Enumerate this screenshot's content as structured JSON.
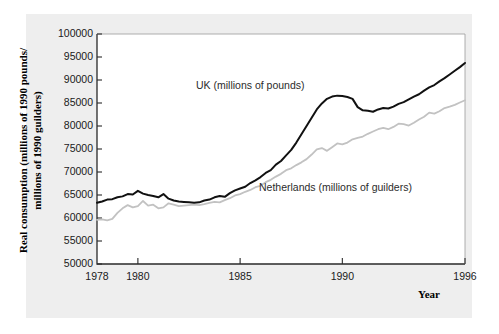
{
  "chart_data": {
    "type": "line",
    "title": "",
    "subtitle": "",
    "xlabel": "Year",
    "ylabel": "Real consumption (millions of 1990 pounds/\nmillions of 1990 guilders)",
    "ylabel_line1": "Real consumption (millions of 1990 pounds/",
    "ylabel_line2": "millions of 1990 guilders)",
    "xlim": [
      1978,
      1996
    ],
    "ylim": [
      50000,
      100000
    ],
    "grid": false,
    "legend_position": "inline-annotations",
    "y_ticks": [
      50000,
      55000,
      60000,
      65000,
      70000,
      75000,
      80000,
      85000,
      90000,
      95000,
      100000
    ],
    "y_tick_labels": [
      "50000",
      "55000",
      "60000",
      "65000",
      "70000",
      "75000",
      "80000",
      "85000",
      "90000",
      "95000",
      "100000"
    ],
    "x_ticks": [
      1978,
      1980,
      1985,
      1990,
      1996
    ],
    "x_tick_labels": [
      "1978",
      "1980",
      "1985",
      "1990",
      "1996"
    ],
    "annotations": [
      {
        "text": "UK (millions of pounds)",
        "x": 1983.6,
        "y": 88000
      },
      {
        "text": "Netherlands (millions of guilders)",
        "x": 1986.8,
        "y": 67500
      }
    ],
    "series": [
      {
        "name": "UK (millions of pounds)",
        "color": "#111111",
        "line_width": 2.0,
        "x": [
          1978.0,
          1978.25,
          1978.5,
          1978.75,
          1979.0,
          1979.25,
          1979.5,
          1979.75,
          1980.0,
          1980.25,
          1980.5,
          1980.75,
          1981.0,
          1981.25,
          1981.5,
          1981.75,
          1982.0,
          1982.25,
          1982.5,
          1982.75,
          1983.0,
          1983.25,
          1983.5,
          1983.75,
          1984.0,
          1984.25,
          1984.5,
          1984.75,
          1985.0,
          1985.25,
          1985.5,
          1985.75,
          1986.0,
          1986.25,
          1986.5,
          1986.75,
          1987.0,
          1987.25,
          1987.5,
          1987.75,
          1988.0,
          1988.25,
          1988.5,
          1988.75,
          1989.0,
          1989.25,
          1989.5,
          1989.75,
          1990.0,
          1990.25,
          1990.5,
          1990.75,
          1991.0,
          1991.25,
          1991.5,
          1991.75,
          1992.0,
          1992.25,
          1992.5,
          1992.75,
          1993.0,
          1993.25,
          1993.5,
          1993.75,
          1994.0,
          1994.25,
          1994.5,
          1994.75,
          1995.0,
          1995.25,
          1995.5,
          1995.75,
          1996.0
        ],
        "values": [
          63300,
          63600,
          64000,
          64100,
          64500,
          64700,
          65200,
          65100,
          65900,
          65300,
          65000,
          64800,
          64500,
          65200,
          64200,
          63800,
          63600,
          63500,
          63400,
          63300,
          63400,
          63800,
          64000,
          64500,
          64800,
          64600,
          65400,
          66000,
          66400,
          66800,
          67600,
          68200,
          68900,
          69800,
          70400,
          71600,
          72400,
          73600,
          74800,
          76400,
          78200,
          80000,
          81800,
          83600,
          84900,
          85900,
          86400,
          86600,
          86500,
          86300,
          85900,
          84100,
          83400,
          83300,
          83100,
          83600,
          83900,
          83800,
          84200,
          84800,
          85200,
          85800,
          86400,
          86900,
          87700,
          88400,
          88900,
          89700,
          90400,
          91200,
          92000,
          92800,
          93700
        ]
      },
      {
        "name": "Netherlands (millions of guilders)",
        "color": "#c2c2c2",
        "line_width": 1.8,
        "x": [
          1978.0,
          1978.25,
          1978.5,
          1978.75,
          1979.0,
          1979.25,
          1979.5,
          1979.75,
          1980.0,
          1980.25,
          1980.5,
          1980.75,
          1981.0,
          1981.25,
          1981.5,
          1981.75,
          1982.0,
          1982.25,
          1982.5,
          1982.75,
          1983.0,
          1983.25,
          1983.5,
          1983.75,
          1984.0,
          1984.25,
          1984.5,
          1984.75,
          1985.0,
          1985.25,
          1985.5,
          1985.75,
          1986.0,
          1986.25,
          1986.5,
          1986.75,
          1987.0,
          1987.25,
          1987.5,
          1987.75,
          1988.0,
          1988.25,
          1988.5,
          1988.75,
          1989.0,
          1989.25,
          1989.5,
          1989.75,
          1990.0,
          1990.25,
          1990.5,
          1990.75,
          1991.0,
          1991.25,
          1991.5,
          1991.75,
          1992.0,
          1992.25,
          1992.5,
          1992.75,
          1993.0,
          1993.25,
          1993.5,
          1993.75,
          1994.0,
          1994.25,
          1994.5,
          1994.75,
          1995.0,
          1995.25,
          1995.5,
          1995.75,
          1996.0
        ],
        "values": [
          59600,
          59700,
          59500,
          59800,
          61100,
          62100,
          62800,
          62300,
          62600,
          63700,
          62700,
          62900,
          62100,
          62300,
          63200,
          62900,
          62600,
          62700,
          62800,
          62900,
          62800,
          63000,
          63300,
          63500,
          63400,
          63900,
          64300,
          64900,
          65200,
          65700,
          66100,
          66700,
          67000,
          67800,
          68300,
          69000,
          69600,
          70400,
          70800,
          71500,
          72100,
          72800,
          73800,
          74900,
          75200,
          74600,
          75400,
          76200,
          76000,
          76400,
          77100,
          77400,
          77700,
          78300,
          78800,
          79300,
          79600,
          79300,
          79800,
          80500,
          80400,
          80100,
          80700,
          81400,
          82000,
          82900,
          82700,
          83200,
          83900,
          84200,
          84600,
          85100,
          85600
        ]
      }
    ]
  },
  "axis": {
    "x_title": "Year"
  }
}
